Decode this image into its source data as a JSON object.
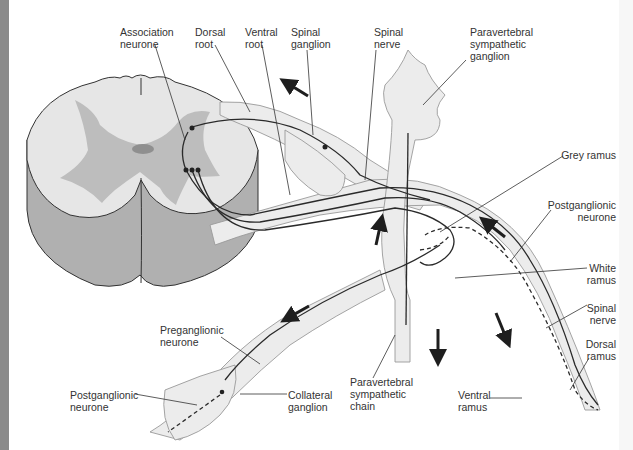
{
  "figure": {
    "colors": {
      "white_matter": "#e6e6e6",
      "grey_matter": "#bdbdbd",
      "cord_side": "#b0b0b0",
      "nerve_fill": "#ececec",
      "fibre": "#2a2a2a",
      "ganglion_shade": "#c8c8c8"
    }
  },
  "labels": {
    "association_neurone": [
      "Association",
      "neurone"
    ],
    "dorsal_root": [
      "Dorsal",
      "root"
    ],
    "ventral_root": [
      "Ventral",
      "root"
    ],
    "spinal_ganglion": [
      "Spinal",
      "ganglion"
    ],
    "spinal_nerve_top": [
      "Spinal",
      "nerve"
    ],
    "paravertebral_ganglion": [
      "Paravertebral",
      "sympathetic",
      "ganglion"
    ],
    "grey_ramus": [
      "Grey ramus"
    ],
    "postganglionic_right": [
      "Postganglionic",
      "neurone"
    ],
    "white_ramus": [
      "White",
      "ramus"
    ],
    "spinal_nerve_right": [
      "Spinal",
      "nerve"
    ],
    "dorsal_ramus": [
      "Dorsal",
      "ramus"
    ],
    "preganglionic": [
      "Preganglionic",
      "neurone"
    ],
    "postganglionic_left": [
      "Postganglionic",
      "neurone"
    ],
    "collateral_ganglion": [
      "Collateral",
      "ganglion"
    ],
    "paravertebral_chain": [
      "Paravertebral",
      "sympathetic",
      "chain"
    ],
    "ventral_ramus": [
      "Ventral",
      "ramus"
    ]
  },
  "arrows": [
    {
      "name": "afferent-arrow",
      "direction": "up-left"
    },
    {
      "name": "chain-up-arrow",
      "direction": "up"
    },
    {
      "name": "grey-ramus-arrow",
      "direction": "up-left"
    },
    {
      "name": "preganglionic-arrow",
      "direction": "down-left"
    },
    {
      "name": "chain-down-arrow",
      "direction": "down"
    },
    {
      "name": "spinal-nerve-arrow",
      "direction": "down-right"
    }
  ]
}
